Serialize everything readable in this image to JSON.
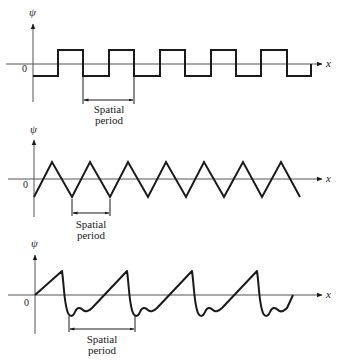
{
  "figure": {
    "panels": [
      {
        "name": "square-wave",
        "y_label": "ψ",
        "x_label": "x",
        "origin_label": "0",
        "period_label_line1": "Spatial",
        "period_label_line2": "period"
      },
      {
        "name": "triangle-wave",
        "y_label": "ψ",
        "x_label": "x",
        "origin_label": "0",
        "period_label_line1": "Spatial",
        "period_label_line2": "period"
      },
      {
        "name": "sawtooth-with-ringing-wave",
        "y_label": "ψ",
        "x_label": "x",
        "origin_label": "0",
        "period_label_line1": "Spatial",
        "period_label_line2": "period"
      }
    ]
  },
  "colors": {
    "ink": "#1a1a1a",
    "axis": "#555555",
    "background": "#ffffff"
  }
}
